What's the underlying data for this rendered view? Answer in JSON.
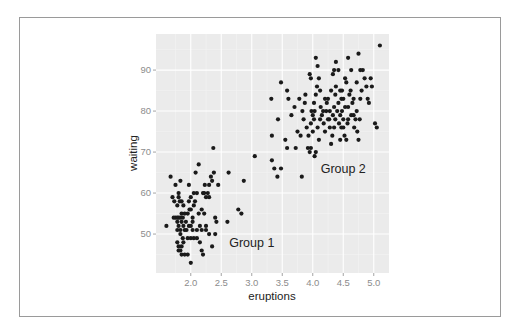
{
  "chart_data": {
    "type": "scatter",
    "title": "",
    "xlabel": "eruptions",
    "ylabel": "waiting",
    "xlim": [
      1.43,
      5.25
    ],
    "ylim": [
      40.5,
      98.8
    ],
    "x_ticks": [
      2.0,
      2.5,
      3.0,
      3.5,
      4.0,
      4.5,
      5.0
    ],
    "x_tick_labels": [
      "2.0",
      "2.5",
      "3.0",
      "3.5",
      "4.0",
      "4.5",
      "5.0"
    ],
    "y_ticks": [
      50,
      60,
      70,
      80,
      90
    ],
    "y_tick_labels": [
      "50",
      "60",
      "70",
      "80",
      "90"
    ],
    "grid": true,
    "legend": null,
    "background": "#ebebeb",
    "point_color": "#1a1a1a",
    "annotations": [
      {
        "text": "Group 1",
        "x": 3.0,
        "y": 48
      },
      {
        "text": "Group 2",
        "x": 4.5,
        "y": 66
      }
    ],
    "points": [
      [
        1.6,
        52
      ],
      [
        1.67,
        64
      ],
      [
        1.75,
        62
      ],
      [
        1.83,
        63
      ],
      [
        1.7,
        59
      ],
      [
        1.73,
        58
      ],
      [
        1.78,
        57
      ],
      [
        1.8,
        60
      ],
      [
        1.8,
        59
      ],
      [
        1.82,
        58
      ],
      [
        1.75,
        54
      ],
      [
        1.78,
        54
      ],
      [
        1.8,
        54
      ],
      [
        1.83,
        54
      ],
      [
        1.85,
        53
      ],
      [
        1.78,
        53
      ],
      [
        1.8,
        52
      ],
      [
        1.83,
        51
      ],
      [
        1.78,
        51
      ],
      [
        1.85,
        55
      ],
      [
        1.87,
        54
      ],
      [
        1.88,
        52
      ],
      [
        1.9,
        51
      ],
      [
        1.83,
        50
      ],
      [
        1.87,
        49
      ],
      [
        1.88,
        48
      ],
      [
        1.85,
        47
      ],
      [
        1.83,
        46
      ],
      [
        1.8,
        47
      ],
      [
        1.78,
        48
      ],
      [
        1.8,
        46
      ],
      [
        1.85,
        45
      ],
      [
        1.9,
        45
      ],
      [
        1.95,
        45
      ],
      [
        2.0,
        43
      ],
      [
        1.95,
        49
      ],
      [
        2.0,
        49
      ],
      [
        2.05,
        49
      ],
      [
        2.1,
        49
      ],
      [
        1.93,
        51
      ],
      [
        1.97,
        52
      ],
      [
        2.0,
        52
      ],
      [
        2.03,
        53
      ],
      [
        1.95,
        55
      ],
      [
        1.98,
        56
      ],
      [
        2.0,
        56
      ],
      [
        2.03,
        54
      ],
      [
        1.97,
        58
      ],
      [
        2.0,
        59
      ],
      [
        2.05,
        57
      ],
      [
        1.97,
        62
      ],
      [
        2.05,
        60
      ],
      [
        2.1,
        60
      ],
      [
        2.07,
        58
      ],
      [
        2.15,
        52
      ],
      [
        2.18,
        51
      ],
      [
        2.1,
        51
      ],
      [
        2.13,
        55
      ],
      [
        2.18,
        56
      ],
      [
        2.2,
        60
      ],
      [
        2.22,
        60
      ],
      [
        2.25,
        59
      ],
      [
        2.23,
        62
      ],
      [
        2.28,
        60
      ],
      [
        2.3,
        59
      ],
      [
        2.3,
        62
      ],
      [
        2.33,
        64
      ],
      [
        2.35,
        63
      ],
      [
        2.38,
        65
      ],
      [
        2.08,
        65
      ],
      [
        2.13,
        67
      ],
      [
        2.37,
        71
      ],
      [
        2.45,
        62
      ],
      [
        2.22,
        55
      ],
      [
        2.25,
        51
      ],
      [
        2.3,
        50
      ],
      [
        2.4,
        50
      ],
      [
        2.35,
        47
      ],
      [
        2.15,
        48
      ],
      [
        2.18,
        46
      ],
      [
        2.2,
        45
      ],
      [
        2.25,
        52
      ],
      [
        2.4,
        54
      ],
      [
        2.42,
        53
      ],
      [
        2.03,
        51
      ],
      [
        1.88,
        57
      ],
      [
        1.92,
        53
      ],
      [
        1.9,
        55
      ],
      [
        1.85,
        58
      ],
      [
        1.72,
        54
      ],
      [
        2.6,
        53
      ],
      [
        2.62,
        65
      ],
      [
        2.78,
        56
      ],
      [
        2.83,
        55
      ],
      [
        2.87,
        63
      ],
      [
        3.05,
        69
      ],
      [
        3.32,
        83
      ],
      [
        3.33,
        74
      ],
      [
        3.33,
        68
      ],
      [
        3.37,
        66
      ],
      [
        3.42,
        64
      ],
      [
        3.43,
        78
      ],
      [
        3.48,
        66
      ],
      [
        3.48,
        87
      ],
      [
        3.55,
        73
      ],
      [
        3.58,
        71
      ],
      [
        3.58,
        85
      ],
      [
        3.6,
        83
      ],
      [
        3.65,
        79
      ],
      [
        3.7,
        81
      ],
      [
        3.72,
        71
      ],
      [
        3.75,
        75
      ],
      [
        3.78,
        83
      ],
      [
        3.8,
        74
      ],
      [
        3.82,
        64
      ],
      [
        3.83,
        80
      ],
      [
        3.85,
        78
      ],
      [
        3.87,
        82
      ],
      [
        3.88,
        84
      ],
      [
        3.9,
        76
      ],
      [
        3.92,
        71
      ],
      [
        3.95,
        70
      ],
      [
        3.93,
        74
      ],
      [
        3.97,
        77
      ],
      [
        4.0,
        79
      ],
      [
        4.03,
        80
      ],
      [
        4.02,
        82
      ],
      [
        4.05,
        84
      ],
      [
        4.07,
        86
      ],
      [
        3.97,
        88
      ],
      [
        3.95,
        89
      ],
      [
        4.05,
        93
      ],
      [
        4.08,
        91
      ],
      [
        4.1,
        88
      ],
      [
        4.12,
        85
      ],
      [
        4.13,
        81
      ],
      [
        4.15,
        79
      ],
      [
        4.18,
        77
      ],
      [
        4.2,
        75
      ],
      [
        4.1,
        73
      ],
      [
        4.05,
        70
      ],
      [
        4.03,
        69
      ],
      [
        3.97,
        71
      ],
      [
        4.0,
        75
      ],
      [
        4.22,
        80
      ],
      [
        4.23,
        82
      ],
      [
        4.25,
        83
      ],
      [
        4.27,
        78
      ],
      [
        4.28,
        76
      ],
      [
        4.3,
        72
      ],
      [
        4.32,
        74
      ],
      [
        4.33,
        79
      ],
      [
        4.35,
        81
      ],
      [
        4.37,
        84
      ],
      [
        4.38,
        86
      ],
      [
        4.33,
        89
      ],
      [
        4.35,
        90
      ],
      [
        4.38,
        92
      ],
      [
        4.42,
        90
      ],
      [
        4.45,
        85
      ],
      [
        4.47,
        83
      ],
      [
        4.48,
        80
      ],
      [
        4.5,
        78
      ],
      [
        4.5,
        76
      ],
      [
        4.52,
        74
      ],
      [
        4.55,
        73
      ],
      [
        4.57,
        77
      ],
      [
        4.58,
        81
      ],
      [
        4.6,
        84
      ],
      [
        4.62,
        85
      ],
      [
        4.55,
        87
      ],
      [
        4.53,
        88
      ],
      [
        4.58,
        93
      ],
      [
        4.63,
        90
      ],
      [
        4.65,
        82
      ],
      [
        4.67,
        79
      ],
      [
        4.68,
        76
      ],
      [
        4.7,
        78
      ],
      [
        4.72,
        80
      ],
      [
        4.73,
        75
      ],
      [
        4.75,
        73
      ],
      [
        4.77,
        78
      ],
      [
        4.78,
        83
      ],
      [
        4.8,
        85
      ],
      [
        4.82,
        90
      ],
      [
        4.75,
        94
      ],
      [
        4.85,
        88
      ],
      [
        4.88,
        86
      ],
      [
        4.9,
        83
      ],
      [
        4.92,
        82
      ],
      [
        4.95,
        88
      ],
      [
        4.97,
        86
      ],
      [
        5.02,
        77
      ],
      [
        5.05,
        76
      ],
      [
        5.1,
        96
      ],
      [
        4.4,
        80
      ],
      [
        4.42,
        82
      ],
      [
        4.45,
        79
      ],
      [
        4.47,
        76
      ],
      [
        4.28,
        80
      ],
      [
        4.25,
        78
      ],
      [
        4.2,
        83
      ],
      [
        4.17,
        80
      ],
      [
        4.12,
        78
      ],
      [
        4.08,
        76
      ],
      [
        4.02,
        78
      ],
      [
        3.98,
        80
      ],
      [
        4.3,
        85
      ],
      [
        4.45,
        73
      ],
      [
        4.63,
        79
      ],
      [
        4.53,
        81
      ],
      [
        4.5,
        83
      ],
      [
        4.48,
        85
      ],
      [
        4.43,
        77
      ],
      [
        4.37,
        78
      ],
      [
        4.35,
        76
      ],
      [
        4.58,
        78
      ],
      [
        4.67,
        83
      ],
      [
        4.72,
        87
      ],
      [
        4.78,
        90
      ]
    ]
  }
}
